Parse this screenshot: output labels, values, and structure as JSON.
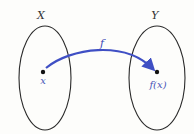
{
  "diagram": {
    "domain_set": {
      "label": "X",
      "element_label": "x"
    },
    "codomain_set": {
      "label": "Y",
      "element_label": "f(x)"
    },
    "mapping": {
      "label": "f",
      "color": "#3f4fc4"
    },
    "colors": {
      "outline": "#2a2a2a",
      "element_text": "#4a56b8",
      "point": "#111111"
    }
  }
}
